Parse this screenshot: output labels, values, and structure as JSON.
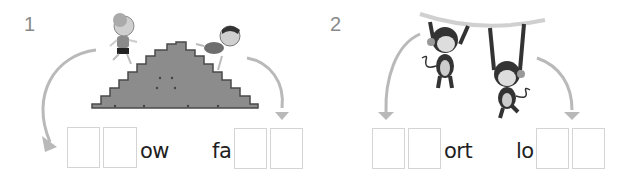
{
  "exercises": [
    {
      "number": "1",
      "illustration": "two children running up and tumbling down a staircase pyramid",
      "word_left": {
        "blanks": 2,
        "suffix": "ow"
      },
      "word_right": {
        "prefix": "fa",
        "blanks": 2
      }
    },
    {
      "number": "2",
      "illustration": "two monkeys hanging from a vine branch",
      "word_left": {
        "blanks": 2,
        "suffix": "ort"
      },
      "word_right": {
        "prefix": "lo",
        "blanks": 2
      }
    }
  ],
  "colors": {
    "arrow": "#b9b9b9",
    "box_border": "#d4d4d4",
    "number": "#8a8a8a",
    "text": "#1f1f1f",
    "stairs": "#8c8c8c"
  }
}
